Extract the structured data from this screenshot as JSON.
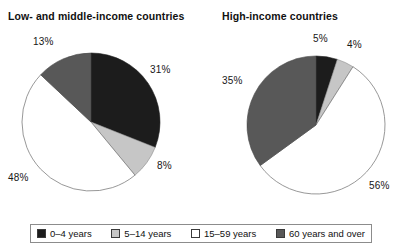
{
  "figure": {
    "legend_box": {
      "items": [
        {
          "label": "0–4 years",
          "color": "#1c1c1c",
          "key": "age_0_4"
        },
        {
          "label": "5–14 years",
          "color": "#c6c6c6",
          "key": "age_5_14"
        },
        {
          "label": "15–59 years",
          "color": "#ffffff",
          "key": "age_15_59"
        },
        {
          "label": "60 years and over",
          "color": "#585858",
          "key": "age_60_plus"
        }
      ]
    }
  },
  "panels": {
    "left": {
      "title": "Low- and middle-income countries",
      "labels": {
        "age_0_4": "31%",
        "age_5_14": "8%",
        "age_15_59": "48%",
        "age_60_plus": "13%"
      }
    },
    "right": {
      "title": "High-income countries",
      "labels": {
        "age_0_4": "5%",
        "age_5_14": "4%",
        "age_15_59": "56%",
        "age_60_plus": "35%"
      }
    }
  },
  "chart_data": [
    {
      "type": "pie",
      "title": "Low- and middle-income countries",
      "categories": [
        "0–4 years",
        "5–14 years",
        "15–59 years",
        "60 years and over"
      ],
      "values": [
        31,
        8,
        48,
        13
      ],
      "value_labels": [
        "31%",
        "8%",
        "48%",
        "13%"
      ],
      "colors": [
        "#1c1c1c",
        "#c6c6c6",
        "#ffffff",
        "#585858"
      ],
      "units": "percent",
      "start_angle_deg": 0,
      "direction": "clockwise",
      "legend_position": "bottom",
      "grid": false
    },
    {
      "type": "pie",
      "title": "High-income countries",
      "categories": [
        "0–4 years",
        "5–14 years",
        "15–59 years",
        "60 years and over"
      ],
      "values": [
        5,
        4,
        56,
        35
      ],
      "value_labels": [
        "5%",
        "4%",
        "56%",
        "35%"
      ],
      "colors": [
        "#1c1c1c",
        "#c6c6c6",
        "#ffffff",
        "#585858"
      ],
      "units": "percent",
      "start_angle_deg": 0,
      "direction": "clockwise",
      "legend_position": "bottom",
      "grid": false
    }
  ]
}
